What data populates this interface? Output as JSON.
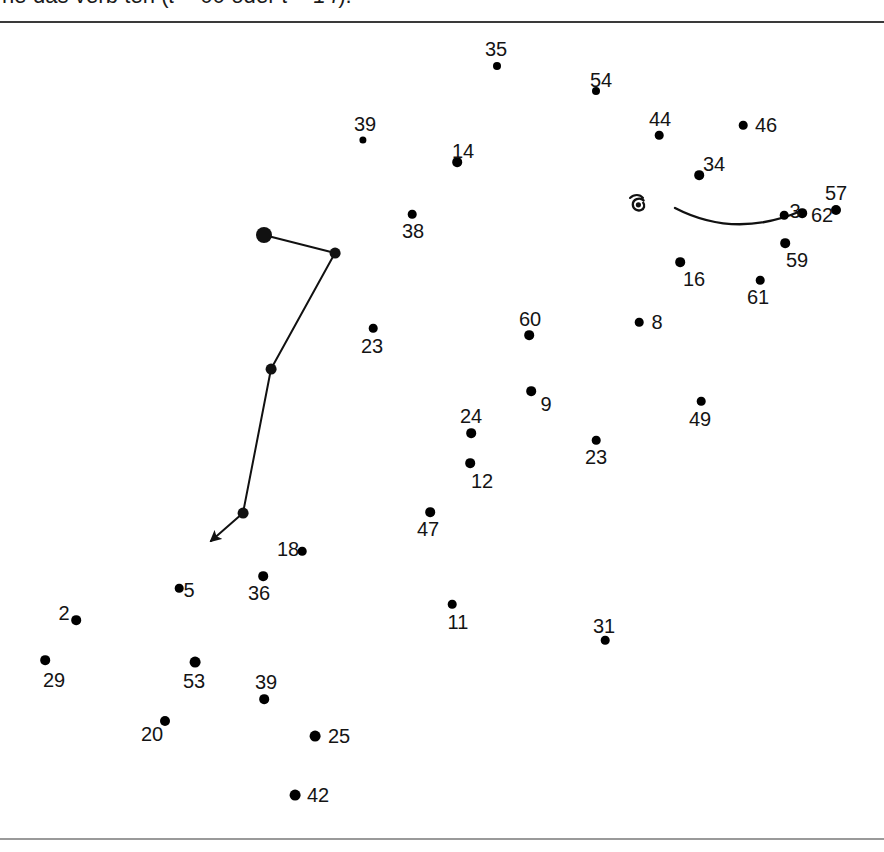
{
  "figure": {
    "caption_prefix": "ne das verb ten (",
    "caption_math_1": "t",
    "caption_eq_1": " = ",
    "caption_val_1": "66",
    "caption_conj": " oder ",
    "caption_math_2": "t",
    "caption_eq_2": " = ",
    "caption_val_2": "14",
    "caption_suffix": ")."
  },
  "colors": {
    "dot": "#000000",
    "label": "#141414",
    "trajectory": "#111111",
    "rule_top": "#3a3a3a",
    "rule_bottom": "#9a9a9a",
    "background": "#ffffff"
  },
  "chart_data": {
    "type": "scatter",
    "title": "",
    "xlabel": "",
    "ylabel": "",
    "xlim": [
      0,
      884
    ],
    "ylim": [
      0,
      815
    ],
    "grid": false,
    "legend": "none",
    "points": [
      {
        "label": "35",
        "x": 497,
        "y": 43,
        "r": 4.0,
        "label_x": 496,
        "label_y": 26
      },
      {
        "label": "54",
        "x": 596,
        "y": 68,
        "r": 4.0,
        "label_x": 601,
        "label_y": 57
      },
      {
        "label": "39",
        "x": 363,
        "y": 117,
        "r": 3.6,
        "label_x": 365,
        "label_y": 101
      },
      {
        "label": "44",
        "x": 659,
        "y": 112,
        "r": 4.3,
        "label_x": 660,
        "label_y": 96
      },
      {
        "label": "46",
        "x": 743,
        "y": 102,
        "r": 4.3,
        "label_x": 766,
        "label_y": 102
      },
      {
        "label": "14",
        "x": 457,
        "y": 139,
        "r": 4.8,
        "label_x": 463,
        "label_y": 128
      },
      {
        "label": "34",
        "x": 699,
        "y": 152,
        "r": 4.8,
        "label_x": 714,
        "label_y": 141
      },
      {
        "label": "3",
        "x": 784,
        "y": 192,
        "r": 4.3,
        "label_x": 795,
        "label_y": 188
      },
      {
        "label": "57",
        "x": 836,
        "y": 187,
        "r": 5.0,
        "label_x": 836,
        "label_y": 170
      },
      {
        "label": "38",
        "x": 412,
        "y": 191,
        "r": 4.3,
        "label_x": 413,
        "label_y": 208
      },
      {
        "label": "62",
        "x": 802,
        "y": 190,
        "r": 4.8,
        "label_x": 822,
        "label_y": 192
      },
      {
        "label": "59",
        "x": 785,
        "y": 220,
        "r": 4.8,
        "label_x": 797,
        "label_y": 237
      },
      {
        "label": "16",
        "x": 680,
        "y": 239,
        "r": 4.8,
        "label_x": 694,
        "label_y": 256
      },
      {
        "label": "61",
        "x": 760,
        "y": 257,
        "r": 4.3,
        "label_x": 758,
        "label_y": 274
      },
      {
        "label": "8",
        "x": 639,
        "y": 299,
        "r": 4.3,
        "label_x": 657,
        "label_y": 299
      },
      {
        "label": "60",
        "x": 529,
        "y": 312,
        "r": 4.8,
        "label_x": 530,
        "label_y": 296
      },
      {
        "label": "23",
        "x": 373,
        "y": 305,
        "r": 4.3,
        "label_x": 372,
        "label_y": 323
      },
      {
        "label": "9",
        "x": 531,
        "y": 368,
        "r": 4.8,
        "label_x": 546,
        "label_y": 381
      },
      {
        "label": "49",
        "x": 701,
        "y": 378,
        "r": 4.3,
        "label_x": 700,
        "label_y": 396
      },
      {
        "label": "24",
        "x": 471,
        "y": 410,
        "r": 4.8,
        "label_x": 471,
        "label_y": 393
      },
      {
        "label": "23",
        "x": 596,
        "y": 417,
        "r": 4.3,
        "label_x": 596,
        "label_y": 434
      },
      {
        "label": "12",
        "x": 470,
        "y": 440,
        "r": 4.8,
        "label_x": 482,
        "label_y": 458
      },
      {
        "label": "47",
        "x": 430,
        "y": 489,
        "r": 4.8,
        "label_x": 428,
        "label_y": 506
      },
      {
        "label": "18",
        "x": 302,
        "y": 528,
        "r": 4.3,
        "label_x": 288,
        "label_y": 526
      },
      {
        "label": "36",
        "x": 263,
        "y": 553,
        "r": 4.8,
        "label_x": 259,
        "label_y": 570
      },
      {
        "label": "5",
        "x": 179,
        "y": 565,
        "r": 4.3,
        "label_x": 189,
        "label_y": 567
      },
      {
        "label": "11",
        "x": 452,
        "y": 581,
        "r": 4.3,
        "label_x": 458,
        "label_y": 599
      },
      {
        "label": "2",
        "x": 76,
        "y": 597,
        "r": 4.8,
        "label_x": 64,
        "label_y": 590
      },
      {
        "label": "31",
        "x": 605,
        "y": 617,
        "r": 4.3,
        "label_x": 604,
        "label_y": 603
      },
      {
        "label": "29",
        "x": 45,
        "y": 637,
        "r": 4.8,
        "label_x": 54,
        "label_y": 657
      },
      {
        "label": "53",
        "x": 195,
        "y": 639,
        "r": 5.4,
        "label_x": 194,
        "label_y": 658
      },
      {
        "label": "39",
        "x": 264,
        "y": 676,
        "r": 4.8,
        "label_x": 266,
        "label_y": 659
      },
      {
        "label": "20",
        "x": 165,
        "y": 698,
        "r": 5.0,
        "label_x": 152,
        "label_y": 711
      },
      {
        "label": "25",
        "x": 315,
        "y": 713,
        "r": 5.4,
        "label_x": 339,
        "label_y": 713
      },
      {
        "label": "42",
        "x": 295,
        "y": 772,
        "r": 5.4,
        "label_x": 318,
        "label_y": 772
      }
    ],
    "trajectory": {
      "name": "movement-path",
      "vertices": [
        {
          "x": 264,
          "y": 212,
          "r": 8.0
        },
        {
          "x": 335,
          "y": 230,
          "r": 5.4
        },
        {
          "x": 271,
          "y": 346,
          "r": 5.4
        },
        {
          "x": 243,
          "y": 490,
          "r": 5.4
        }
      ],
      "arrow_tip": {
        "x": 211,
        "y": 518
      },
      "stroke_width": 2.0
    },
    "arc": {
      "name": "curved-stroke",
      "start": {
        "x": 675,
        "y": 185
      },
      "control": {
        "x": 735,
        "y": 216
      },
      "end": {
        "x": 801,
        "y": 188
      },
      "stroke_width": 2.4
    },
    "spiral": {
      "name": "spiral-glyph",
      "x": 639,
      "y": 181
    }
  }
}
